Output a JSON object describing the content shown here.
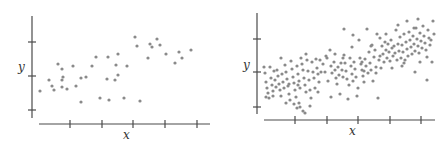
{
  "chart_data": [
    {
      "type": "scatter",
      "title": "",
      "xlabel": "x",
      "ylabel": "y",
      "grid": false,
      "legend": null,
      "x_ticks": 5,
      "y_ticks": 3,
      "tick_labels": "none",
      "description": "Sparse scatter (~40 points) with weak positive correlation",
      "points_px": [
        [
          40,
          91
        ],
        [
          49,
          80
        ],
        [
          52,
          86
        ],
        [
          54,
          90
        ],
        [
          58,
          64
        ],
        [
          62,
          69
        ],
        [
          62,
          80
        ],
        [
          63,
          77
        ],
        [
          62,
          87
        ],
        [
          67,
          89
        ],
        [
          73,
          66
        ],
        [
          76,
          86
        ],
        [
          81,
          102
        ],
        [
          81,
          78
        ],
        [
          86,
          77
        ],
        [
          92,
          66
        ],
        [
          96,
          57
        ],
        [
          100,
          98
        ],
        [
          107,
          79
        ],
        [
          108,
          57
        ],
        [
          109,
          100
        ],
        [
          115,
          80
        ],
        [
          116,
          65
        ],
        [
          118,
          54
        ],
        [
          118,
          75
        ],
        [
          124,
          98
        ],
        [
          127,
          66
        ],
        [
          135,
          37
        ],
        [
          137,
          46
        ],
        [
          140,
          101
        ],
        [
          148,
          58
        ],
        [
          150,
          44
        ],
        [
          152,
          47
        ],
        [
          157,
          39
        ],
        [
          160,
          45
        ],
        [
          166,
          54
        ],
        [
          175,
          63
        ],
        [
          179,
          52
        ],
        [
          182,
          58
        ],
        [
          191,
          50
        ]
      ]
    },
    {
      "type": "scatter",
      "title": "",
      "xlabel": "x",
      "ylabel": "y",
      "grid": false,
      "legend": null,
      "x_ticks": 5,
      "y_ticks": 3,
      "tick_labels": "none",
      "description": "Dense scatter (~200 points) with moderate positive correlation",
      "points_px": [
        [
          264,
          67
        ],
        [
          265,
          73
        ],
        [
          266,
          82
        ],
        [
          267,
          88
        ],
        [
          268,
          93
        ],
        [
          269,
          98
        ],
        [
          270,
          67
        ],
        [
          271,
          78
        ],
        [
          272,
          85
        ],
        [
          273,
          91
        ],
        [
          274,
          71
        ],
        [
          275,
          80
        ],
        [
          276,
          87
        ],
        [
          277,
          70
        ],
        [
          278,
          76
        ],
        [
          279,
          84
        ],
        [
          280,
          90
        ],
        [
          281,
          96
        ],
        [
          282,
          74
        ],
        [
          283,
          82
        ],
        [
          284,
          88
        ],
        [
          285,
          65
        ],
        [
          286,
          72
        ],
        [
          287,
          79
        ],
        [
          288,
          86
        ],
        [
          289,
          94
        ],
        [
          290,
          100
        ],
        [
          291,
          61
        ],
        [
          292,
          69
        ],
        [
          293,
          77
        ],
        [
          294,
          83
        ],
        [
          295,
          90
        ],
        [
          296,
          97
        ],
        [
          297,
          66
        ],
        [
          298,
          74
        ],
        [
          299,
          81
        ],
        [
          300,
          88
        ],
        [
          301,
          58
        ],
        [
          302,
          64
        ],
        [
          303,
          70
        ],
        [
          304,
          78
        ],
        [
          305,
          85
        ],
        [
          306,
          92
        ],
        [
          297,
          108
        ],
        [
          300,
          107
        ],
        [
          299,
          103
        ],
        [
          303,
          111
        ],
        [
          294,
          104
        ],
        [
          306,
          54
        ],
        [
          307,
          60
        ],
        [
          308,
          71
        ],
        [
          309,
          80
        ],
        [
          310,
          90
        ],
        [
          311,
          98
        ],
        [
          312,
          62
        ],
        [
          313,
          72
        ],
        [
          314,
          78
        ],
        [
          315,
          88
        ],
        [
          316,
          59
        ],
        [
          317,
          68
        ],
        [
          318,
          74
        ],
        [
          319,
          82
        ],
        [
          320,
          60
        ],
        [
          321,
          72
        ],
        [
          323,
          64
        ],
        [
          325,
          72
        ],
        [
          327,
          58
        ],
        [
          328,
          81
        ],
        [
          330,
          50
        ],
        [
          331,
          66
        ],
        [
          332,
          73
        ],
        [
          334,
          62
        ],
        [
          335,
          70
        ],
        [
          336,
          78
        ],
        [
          337,
          84
        ],
        [
          338,
          67
        ],
        [
          339,
          75
        ],
        [
          340,
          94
        ],
        [
          341,
          63
        ],
        [
          342,
          70
        ],
        [
          343,
          77
        ],
        [
          344,
          55
        ],
        [
          345,
          63
        ],
        [
          346,
          71
        ],
        [
          347,
          79
        ],
        [
          348,
          99
        ],
        [
          349,
          85
        ],
        [
          350,
          58
        ],
        [
          351,
          66
        ],
        [
          352,
          74
        ],
        [
          353,
          81
        ],
        [
          354,
          62
        ],
        [
          355,
          69
        ],
        [
          356,
          77
        ],
        [
          357,
          96
        ],
        [
          358,
          88
        ],
        [
          359,
          40
        ],
        [
          360,
          58
        ],
        [
          361,
          64
        ],
        [
          362,
          70
        ],
        [
          363,
          76
        ],
        [
          364,
          82
        ],
        [
          365,
          59
        ],
        [
          366,
          66
        ],
        [
          367,
          29
        ],
        [
          368,
          73
        ],
        [
          369,
          52
        ],
        [
          370,
          63
        ],
        [
          371,
          70
        ],
        [
          372,
          45
        ],
        [
          373,
          81
        ],
        [
          374,
          57
        ],
        [
          375,
          50
        ],
        [
          376,
          67
        ],
        [
          377,
          34
        ],
        [
          378,
          98
        ],
        [
          379,
          60
        ],
        [
          380,
          56
        ],
        [
          381,
          68
        ],
        [
          382,
          46
        ],
        [
          383,
          54
        ],
        [
          384,
          62
        ],
        [
          385,
          42
        ],
        [
          386,
          50
        ],
        [
          387,
          58
        ],
        [
          388,
          44
        ],
        [
          389,
          52
        ],
        [
          390,
          61
        ],
        [
          391,
          40
        ],
        [
          392,
          48
        ],
        [
          393,
          56
        ],
        [
          394,
          46
        ],
        [
          395,
          53
        ],
        [
          396,
          30
        ],
        [
          397,
          60
        ],
        [
          398,
          44
        ],
        [
          399,
          51
        ],
        [
          400,
          37
        ],
        [
          401,
          58
        ],
        [
          402,
          45
        ],
        [
          403,
          52
        ],
        [
          404,
          34
        ],
        [
          405,
          60
        ],
        [
          406,
          42
        ],
        [
          407,
          49
        ],
        [
          408,
          56
        ],
        [
          409,
          32
        ],
        [
          410,
          40
        ],
        [
          411,
          47
        ],
        [
          412,
          54
        ],
        [
          413,
          36
        ],
        [
          414,
          44
        ],
        [
          415,
          51
        ],
        [
          416,
          28
        ],
        [
          417,
          39
        ],
        [
          418,
          46
        ],
        [
          419,
          53
        ],
        [
          420,
          33
        ],
        [
          421,
          41
        ],
        [
          422,
          48
        ],
        [
          423,
          26
        ],
        [
          424,
          36
        ],
        [
          425,
          43
        ],
        [
          426,
          50
        ],
        [
          427,
          57
        ],
        [
          428,
          30
        ],
        [
          429,
          38
        ],
        [
          430,
          45
        ],
        [
          431,
          40
        ],
        [
          432,
          62
        ],
        [
          433,
          21
        ],
        [
          434,
          34
        ],
        [
          420,
          62
        ],
        [
          414,
          28
        ],
        [
          402,
          66
        ],
        [
          392,
          68
        ],
        [
          380,
          38
        ],
        [
          371,
          46
        ],
        [
          362,
          62
        ],
        [
          352,
          47
        ],
        [
          343,
          58
        ],
        [
          335,
          54
        ],
        [
          326,
          56
        ],
        [
          318,
          92
        ],
        [
          310,
          106
        ],
        [
          305,
          113
        ],
        [
          298,
          85
        ],
        [
          289,
          84
        ],
        [
          281,
          58
        ],
        [
          273,
          96
        ],
        [
          266,
          97
        ],
        [
          286,
          103
        ],
        [
          331,
          97
        ],
        [
          344,
          29
        ],
        [
          353,
          35
        ],
        [
          364,
          71
        ],
        [
          376,
          73
        ],
        [
          386,
          34
        ],
        [
          398,
          25
        ],
        [
          407,
          21
        ],
        [
          418,
          19
        ],
        [
          427,
          80
        ],
        [
          415,
          72
        ],
        [
          404,
          63
        ]
      ]
    }
  ],
  "charts": {
    "left": {
      "xlabel": "x",
      "ylabel": "y"
    },
    "right": {
      "xlabel": "x",
      "ylabel": "y"
    }
  }
}
